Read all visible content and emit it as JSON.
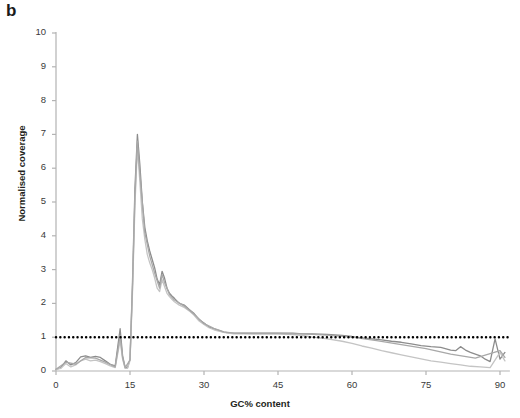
{
  "figure": {
    "panel_label": "b",
    "background": "#ffffff"
  },
  "axes": {
    "ylabel": "Normalised coverage",
    "xlabel": "GC% content",
    "axis_color": "#b3b3b3",
    "tick_label_color": "#3a3a3a"
  },
  "chart_data": {
    "type": "line",
    "title": "",
    "subtitle": "",
    "xlabel": "GC% content",
    "ylabel": "Normalised coverage",
    "xlim": [
      0,
      92
    ],
    "ylim": [
      0,
      10
    ],
    "xticks": [
      0,
      15,
      30,
      45,
      60,
      75,
      90
    ],
    "yticks": [
      0,
      1,
      2,
      3,
      4,
      5,
      6,
      7,
      8,
      9,
      10
    ],
    "grid": false,
    "legend": "none",
    "annotations": [
      {
        "name": "reference-line",
        "type": "hline",
        "y": 1,
        "style": "dotted",
        "color": "#000000",
        "label": "normalised coverage = 1"
      }
    ],
    "series": [
      {
        "name": "sample-dark",
        "color": "#8c8c8c",
        "x": [
          0,
          1,
          2,
          3,
          4,
          5,
          6,
          7,
          8,
          9,
          10,
          11,
          12,
          13,
          13.5,
          14,
          14.5,
          15,
          15.5,
          16,
          16.5,
          17,
          17.5,
          18,
          18.5,
          19,
          19.5,
          20,
          20.5,
          21,
          21.5,
          22,
          22.5,
          23,
          23.5,
          24,
          25,
          26,
          27,
          28,
          29,
          30,
          31,
          32,
          33,
          34,
          35,
          36,
          38,
          40,
          42,
          45,
          48,
          50,
          52,
          55,
          58,
          60,
          62,
          64,
          66,
          68,
          70,
          72,
          74,
          76,
          78,
          80,
          81,
          82,
          83,
          84,
          85,
          86,
          87,
          88,
          89,
          90,
          91
        ],
        "y": [
          0.05,
          0.1,
          0.3,
          0.18,
          0.25,
          0.42,
          0.45,
          0.4,
          0.43,
          0.4,
          0.3,
          0.2,
          0.15,
          1.25,
          0.45,
          0.12,
          0.1,
          0.35,
          2.6,
          5.4,
          7.0,
          6.1,
          5.0,
          4.25,
          3.85,
          3.55,
          3.3,
          3.05,
          2.72,
          2.55,
          2.95,
          2.75,
          2.45,
          2.3,
          2.22,
          2.15,
          2.0,
          1.95,
          1.82,
          1.7,
          1.52,
          1.42,
          1.3,
          1.25,
          1.2,
          1.15,
          1.13,
          1.12,
          1.12,
          1.12,
          1.12,
          1.12,
          1.12,
          1.1,
          1.1,
          1.08,
          1.05,
          1.02,
          0.98,
          0.95,
          0.92,
          0.88,
          0.85,
          0.8,
          0.75,
          0.72,
          0.7,
          0.62,
          0.6,
          0.72,
          0.62,
          0.55,
          0.5,
          0.45,
          0.35,
          0.28,
          0.95,
          0.35,
          0.55
        ]
      },
      {
        "name": "sample-light",
        "color": "#c4c4c4",
        "x": [
          0,
          1,
          2,
          3,
          4,
          5,
          6,
          7,
          8,
          9,
          10,
          11,
          12,
          13,
          13.5,
          14,
          14.5,
          15,
          15.5,
          16,
          16.5,
          17,
          17.5,
          18,
          18.5,
          19,
          19.5,
          20,
          20.5,
          21,
          21.5,
          22,
          22.5,
          23,
          23.5,
          24,
          25,
          26,
          27,
          28,
          29,
          30,
          31,
          32,
          33,
          34,
          35,
          36,
          38,
          40,
          42,
          45,
          48,
          50,
          52,
          55,
          58,
          60,
          62,
          64,
          66,
          68,
          70,
          72,
          74,
          76,
          78,
          80,
          82,
          84,
          86,
          88,
          90,
          91
        ],
        "y": [
          0.05,
          0.08,
          0.22,
          0.12,
          0.18,
          0.3,
          0.35,
          0.3,
          0.32,
          0.28,
          0.22,
          0.15,
          0.1,
          0.9,
          0.35,
          0.08,
          0.08,
          0.3,
          2.3,
          4.9,
          6.6,
          5.6,
          4.5,
          3.9,
          3.45,
          3.2,
          3.0,
          2.75,
          2.45,
          2.35,
          2.7,
          2.5,
          2.3,
          2.2,
          2.12,
          2.05,
          1.95,
          1.88,
          1.78,
          1.65,
          1.48,
          1.38,
          1.28,
          1.22,
          1.18,
          1.14,
          1.12,
          1.1,
          1.1,
          1.1,
          1.1,
          1.1,
          1.08,
          1.05,
          1.0,
          0.95,
          0.88,
          0.82,
          0.74,
          0.68,
          0.6,
          0.54,
          0.48,
          0.42,
          0.36,
          0.3,
          0.26,
          0.22,
          0.18,
          0.14,
          0.12,
          0.1,
          0.55,
          0.3
        ]
      },
      {
        "name": "sample-mid",
        "color": "#a8a8a8",
        "x": [
          0,
          2,
          4,
          6,
          8,
          10,
          12,
          13,
          13.5,
          14,
          15,
          15.5,
          16,
          16.5,
          17,
          18,
          19,
          20,
          21,
          21.5,
          22,
          23,
          24,
          26,
          28,
          30,
          32,
          34,
          36,
          40,
          45,
          50,
          55,
          60,
          65,
          70,
          75,
          80,
          85,
          90,
          91
        ],
        "y": [
          0.05,
          0.26,
          0.2,
          0.4,
          0.38,
          0.26,
          0.12,
          1.05,
          0.4,
          0.1,
          0.32,
          2.45,
          5.15,
          6.8,
          5.85,
          4.1,
          3.4,
          2.9,
          2.45,
          2.85,
          2.62,
          2.26,
          2.1,
          1.92,
          1.68,
          1.4,
          1.26,
          1.16,
          1.12,
          1.11,
          1.11,
          1.1,
          1.06,
          1.0,
          0.9,
          0.78,
          0.66,
          0.5,
          0.38,
          0.6,
          0.4
        ]
      }
    ]
  }
}
